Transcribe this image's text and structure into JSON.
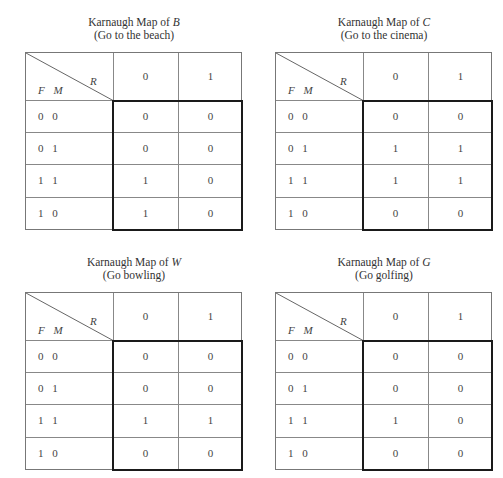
{
  "maps": [
    {
      "title_prefix": "Karnaugh Map of ",
      "variable": "B",
      "subtitle": "(Go to the beach)",
      "row_var_label": "F  M",
      "col_var_label": "R",
      "columns": [
        "0",
        "1"
      ],
      "rows": [
        {
          "label": "0  0",
          "values": [
            "0",
            "0"
          ]
        },
        {
          "label": "0  1",
          "values": [
            "0",
            "0"
          ]
        },
        {
          "label": "1  1",
          "values": [
            "1",
            "0"
          ]
        },
        {
          "label": "1  0",
          "values": [
            "1",
            "0"
          ]
        }
      ]
    },
    {
      "title_prefix": "Karnaugh Map of ",
      "variable": "C",
      "subtitle": "(Go to the cinema)",
      "row_var_label": "F  M",
      "col_var_label": "R",
      "columns": [
        "0",
        "1"
      ],
      "rows": [
        {
          "label": "0  0",
          "values": [
            "0",
            "0"
          ]
        },
        {
          "label": "0  1",
          "values": [
            "1",
            "1"
          ]
        },
        {
          "label": "1  1",
          "values": [
            "1",
            "1"
          ]
        },
        {
          "label": "1  0",
          "values": [
            "0",
            "0"
          ]
        }
      ]
    },
    {
      "title_prefix": "Karnaugh Map of ",
      "variable": "W",
      "subtitle": "(Go bowling)",
      "row_var_label": "F  M",
      "col_var_label": "R",
      "columns": [
        "0",
        "1"
      ],
      "rows": [
        {
          "label": "0  0",
          "values": [
            "0",
            "0"
          ]
        },
        {
          "label": "0  1",
          "values": [
            "0",
            "0"
          ]
        },
        {
          "label": "1  1",
          "values": [
            "1",
            "1"
          ]
        },
        {
          "label": "1  0",
          "values": [
            "0",
            "0"
          ]
        }
      ]
    },
    {
      "title_prefix": "Karnaugh Map of ",
      "variable": "G",
      "subtitle": "(Go golfing)",
      "row_var_label": "F  M",
      "col_var_label": "R",
      "columns": [
        "0",
        "1"
      ],
      "rows": [
        {
          "label": "0  0",
          "values": [
            "0",
            "0"
          ]
        },
        {
          "label": "0  1",
          "values": [
            "0",
            "0"
          ]
        },
        {
          "label": "1  1",
          "values": [
            "1",
            "0"
          ]
        },
        {
          "label": "1  0",
          "values": [
            "0",
            "0"
          ]
        }
      ]
    }
  ]
}
